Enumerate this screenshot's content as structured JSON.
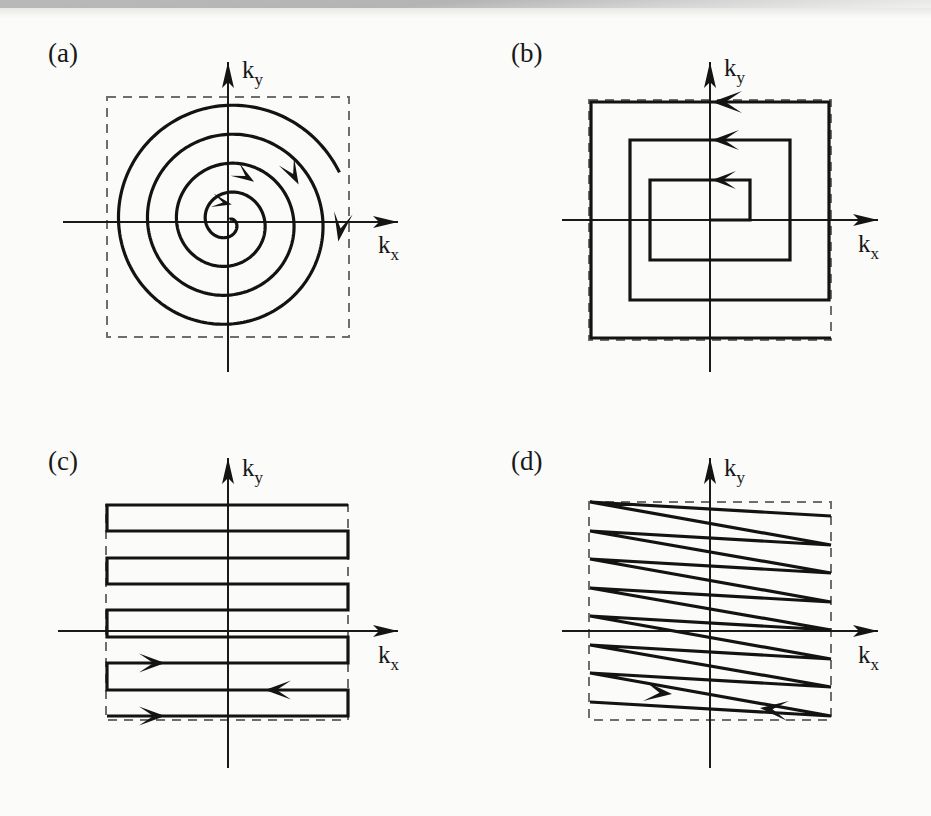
{
  "figure": {
    "kind": "k-space trajectory schematic",
    "background_color": "#fbfbfa",
    "ink_color": "#131313",
    "dashed_box_color": "#6e6e6e",
    "panel_count": 4
  },
  "panels": [
    {
      "label": "(a)",
      "trajectory_name": "spiral",
      "axis_x_label_base": "k",
      "axis_x_label_sub": "x",
      "axis_y_label_base": "k",
      "axis_y_label_sub": "y",
      "arrow_count": 4,
      "direction": "clockwise outward from center"
    },
    {
      "label": "(b)",
      "trajectory_name": "square spiral",
      "axis_x_label_base": "k",
      "axis_x_label_sub": "x",
      "axis_y_label_base": "k",
      "axis_y_label_sub": "y",
      "arrow_count": 3,
      "direction": "outward from center, leftward along top edges"
    },
    {
      "label": "(c)",
      "trajectory_name": "raster / boustrophedon echo-planar",
      "axis_x_label_base": "k",
      "axis_x_label_sub": "x",
      "axis_y_label_base": "k",
      "axis_y_label_sub": "y",
      "arrow_count": 3,
      "direction": "alternating left-right, bottom to top"
    },
    {
      "label": "(d)",
      "trajectory_name": "zigzag echo-planar",
      "axis_x_label_base": "k",
      "axis_x_label_sub": "x",
      "axis_y_label_base": "k",
      "axis_y_label_sub": "y",
      "arrow_count": 2,
      "direction": "continuous triangular sweep, bottom to top"
    }
  ],
  "chart_data": {
    "type": "line",
    "title": "",
    "xlabel": "k_x",
    "ylabel": "k_y",
    "grid": false,
    "legend": "none",
    "subplots": [
      {
        "panel": "(a)",
        "name": "spiral",
        "origin": [
          228,
          222
        ],
        "dashed_box": {
          "x": 107,
          "y": 97,
          "w": 242,
          "h": 240
        },
        "spiral": {
          "turns": 4.1,
          "start_radius": 3,
          "end_radius": 122,
          "start_angle_deg": 60,
          "sweep": "clockwise"
        },
        "arrow_angles_deg": [
          78,
          57,
          28,
          350
        ],
        "arrow_radii": [
          18,
          48,
          80,
          112
        ]
      },
      {
        "panel": "(b)",
        "name": "square-spiral",
        "origin": [
          710,
          220
        ],
        "dashed_box": {
          "x": 589,
          "y": 100,
          "w": 242,
          "h": 240
        },
        "vertices": [
          [
            710,
            220
          ],
          [
            750,
            220
          ],
          [
            750,
            180
          ],
          [
            650,
            180
          ],
          [
            650,
            260
          ],
          [
            790,
            260
          ],
          [
            790,
            140
          ],
          [
            630,
            140
          ],
          [
            630,
            300
          ],
          [
            829,
            300
          ],
          [
            829,
            102
          ],
          [
            591,
            102
          ],
          [
            591,
            338
          ],
          [
            831,
            338
          ]
        ],
        "arrow_positions": [
          [
            712,
            180
          ],
          [
            712,
            140
          ],
          [
            712,
            102
          ]
        ],
        "arrow_direction": "left"
      },
      {
        "panel": "(c)",
        "name": "raster",
        "origin": [
          228,
          631
        ],
        "dashed_box": {
          "x": 106,
          "y": 505,
          "w": 242,
          "h": 215
        },
        "line_x_left": 107,
        "line_x_right": 348,
        "line_y_values": [
          505,
          531,
          558,
          584,
          610,
          637,
          663,
          690,
          716
        ],
        "line_directions": [
          "right",
          "left",
          "right",
          "left",
          "right",
          "left",
          "right",
          "left",
          "right"
        ],
        "arrows": [
          {
            "x": 165,
            "y": 663,
            "dir": "right"
          },
          {
            "x": 265,
            "y": 690,
            "dir": "left"
          },
          {
            "x": 165,
            "y": 716,
            "dir": "right"
          }
        ]
      },
      {
        "panel": "(d)",
        "name": "zigzag",
        "origin": [
          710,
          631
        ],
        "dashed_box": {
          "x": 589,
          "y": 502,
          "w": 242,
          "h": 218
        },
        "x_left": 590,
        "x_right": 831,
        "left_vertex_y": [
          502,
          531,
          559,
          588,
          616,
          645,
          673,
          702
        ],
        "right_vertex_y": [
          516,
          545,
          573,
          602,
          630,
          659,
          687,
          716
        ],
        "arrows": [
          {
            "x": 672,
            "y": 694,
            "dir": "right"
          },
          {
            "x": 760,
            "y": 708,
            "dir": "left"
          }
        ]
      }
    ]
  }
}
